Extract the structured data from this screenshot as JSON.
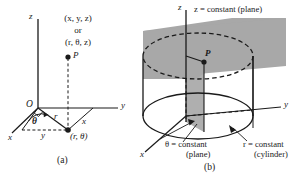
{
  "figure": {
    "title_visible": false,
    "background_color": "#ffffff",
    "ink_color": "#1a1a1a",
    "plane_fill_color": "#a8a8a8",
    "panels": [
      {
        "id": "a",
        "caption": "(a)",
        "axes": [
          {
            "name": "z-axis",
            "label": "z"
          },
          {
            "name": "y-axis",
            "label": "y"
          },
          {
            "name": "x-axis",
            "label": "x"
          },
          {
            "name": "y-axis-projection",
            "label": "y"
          },
          {
            "name": "x-axis-projection",
            "label": "x"
          }
        ],
        "origin_label": "O",
        "point_label": "P",
        "coordinate_text_line1": "(x, y, z)",
        "coordinate_text_line2": "or",
        "coordinate_text_line3": "(r, θ, z)",
        "radius_label": "r",
        "angle_label": "θ",
        "foot_point_label": "(r, θ)"
      },
      {
        "id": "b",
        "caption": "(b)",
        "axes": [
          {
            "name": "z-axis",
            "label": "z"
          },
          {
            "name": "y-axis",
            "label": "y"
          },
          {
            "name": "x-axis",
            "label": "x"
          }
        ],
        "point_label": "P",
        "surfaces": [
          {
            "name": "z-constant-plane",
            "text": "z = constant (plane)",
            "variable": "z",
            "value": "constant",
            "kind": "(plane)"
          },
          {
            "name": "theta-constant-plane",
            "text_line1": "θ = constant",
            "text_line2": "(plane)",
            "variable": "θ",
            "value": "constant",
            "kind": "(plane)"
          },
          {
            "name": "r-constant-cylinder",
            "text_line1": "r = constant",
            "text_line2": "(cylinder)",
            "variable": "r",
            "value": "constant",
            "kind": "(cylinder)"
          }
        ]
      }
    ]
  }
}
